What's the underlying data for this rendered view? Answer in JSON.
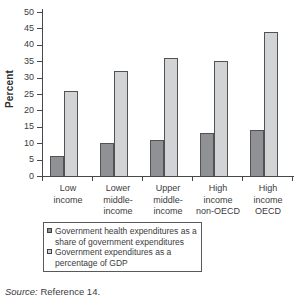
{
  "chart_data": {
    "type": "bar",
    "title": "",
    "ylabel": "Percent",
    "xlabel": "",
    "ylim": [
      0,
      50
    ],
    "ytick_step": 5,
    "yticks": [
      0,
      5,
      10,
      15,
      20,
      25,
      30,
      35,
      40,
      45,
      50
    ],
    "grid": false,
    "legend_position": "bottom-box",
    "categories": [
      {
        "label": "Low income",
        "lines": [
          "Low",
          "income"
        ]
      },
      {
        "label": "Lower middle-income",
        "lines": [
          "Lower",
          "middle-",
          "income"
        ]
      },
      {
        "label": "Upper middle-income",
        "lines": [
          "Upper",
          "middle-",
          "income"
        ]
      },
      {
        "label": "High income non-OECD",
        "lines": [
          "High",
          "income",
          "non-OECD"
        ]
      },
      {
        "label": "High income OECD",
        "lines": [
          "High",
          "income",
          "OECD"
        ]
      }
    ],
    "series": [
      {
        "name": "Government health expenditures as a share of government expenditures",
        "color": "#8f9194",
        "values": [
          6,
          10,
          11,
          13,
          14
        ]
      },
      {
        "name": "Government expenditures as a percentage of GDP",
        "color": "#d2d3d4",
        "values": [
          26,
          32,
          36,
          35,
          44
        ]
      }
    ],
    "colors": {
      "bar_border": "#505254",
      "axis": "#47484a",
      "text": "#3b3b3d"
    }
  },
  "source": {
    "prefix": "Source:",
    "text": " Reference 14."
  }
}
